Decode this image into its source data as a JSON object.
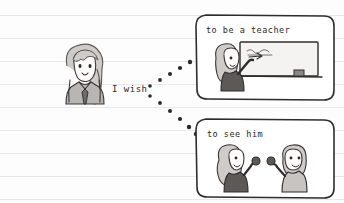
{
  "page": {
    "medium": "ruled-notebook-paper",
    "paper_color": "#fdfdfd",
    "rule_color": "#e9e9ec",
    "ink_color": "#2f2c2c",
    "rule_count": 9,
    "rule_spacing_px": 23,
    "rule_first_y_px": 15
  },
  "caption": {
    "text": "I wish",
    "x": 112,
    "y": 90
  },
  "narrator": {
    "name": "girl-with-long-hair",
    "hair_color": "#cfcbc9",
    "uniform_color": "#b9b5b3",
    "tie_color": "#6e6a68",
    "x": 58,
    "y": 48,
    "width": 52,
    "height": 56
  },
  "thought_trails": [
    {
      "name": "trail-to-top-panel",
      "target": "panel-teacher",
      "dots": [
        {
          "x": 150,
          "y": 86,
          "r": 1.8
        },
        {
          "x": 160,
          "y": 80,
          "r": 1.9
        },
        {
          "x": 170,
          "y": 74,
          "r": 2.0
        },
        {
          "x": 180,
          "y": 68,
          "r": 2.1
        },
        {
          "x": 190,
          "y": 62,
          "r": 2.2
        }
      ]
    },
    {
      "name": "trail-to-bottom-panel",
      "target": "panel-reunion",
      "dots": [
        {
          "x": 150,
          "y": 96,
          "r": 1.8
        },
        {
          "x": 160,
          "y": 103,
          "r": 1.9
        },
        {
          "x": 170,
          "y": 111,
          "r": 2.0
        },
        {
          "x": 180,
          "y": 119,
          "r": 2.1
        },
        {
          "x": 189,
          "y": 127,
          "r": 2.2
        },
        {
          "x": 196,
          "y": 134,
          "r": 2.2
        }
      ]
    }
  ],
  "panels": [
    {
      "name": "panel-teacher",
      "caption": "to be a teacher",
      "x": 196,
      "y": 14,
      "width": 138,
      "height": 86,
      "scene": "girl pointing at a blackboard with chalk writing and an eraser on the ledge",
      "elements": {
        "blackboard_label": "blackboard",
        "chalk_writing": "scribble",
        "eraser": "eraser",
        "figure": "teacher-girl"
      }
    },
    {
      "name": "panel-reunion",
      "caption": "to see him",
      "x": 196,
      "y": 118,
      "width": 138,
      "height": 80,
      "scene": "girl and boy waving to each other",
      "elements": {
        "figure_left": "girl-waving",
        "figure_right": "boy-waving"
      }
    }
  ],
  "palette": {
    "ink": "#2f2c2c",
    "hair_light": "#cfcbc9",
    "uniform_dark": "#5d5957",
    "shirt_light": "#c8c4c2",
    "board_fill": "#f4f3f2",
    "skin": "#fbfaf9"
  }
}
